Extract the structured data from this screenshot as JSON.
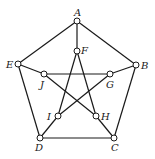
{
  "nodes": [
    {
      "id": "A",
      "label": "A"
    },
    {
      "id": "B",
      "label": "B"
    },
    {
      "id": "C",
      "label": "C"
    },
    {
      "id": "D",
      "label": "D"
    },
    {
      "id": "E",
      "label": "E"
    },
    {
      "id": "F",
      "label": "F"
    },
    {
      "id": "G",
      "label": "G"
    },
    {
      "id": "H",
      "label": "H"
    },
    {
      "id": "I",
      "label": "I"
    },
    {
      "id": "J",
      "label": "J"
    }
  ],
  "edges": [
    [
      "A",
      "B"
    ],
    [
      "B",
      "C"
    ],
    [
      "C",
      "D"
    ],
    [
      "D",
      "E"
    ],
    [
      "E",
      "A"
    ],
    [
      "A",
      "F"
    ],
    [
      "B",
      "G"
    ],
    [
      "C",
      "H"
    ],
    [
      "D",
      "I"
    ],
    [
      "E",
      "J"
    ],
    [
      "F",
      "H"
    ],
    [
      "H",
      "J"
    ],
    [
      "J",
      "G"
    ],
    [
      "G",
      "I"
    ],
    [
      "I",
      "F"
    ]
  ]
}
